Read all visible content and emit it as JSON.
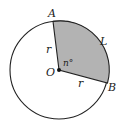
{
  "diagram": {
    "type": "circle-sector",
    "center_label": "O",
    "point_a_label": "A",
    "point_b_label": "B",
    "radius_label_1": "r",
    "radius_label_2": "r",
    "arc_label": "L",
    "angle_label": "n°",
    "colors": {
      "stroke": "#222222",
      "sector_fill": "#b3b3b3",
      "background": "#ffffff"
    }
  }
}
